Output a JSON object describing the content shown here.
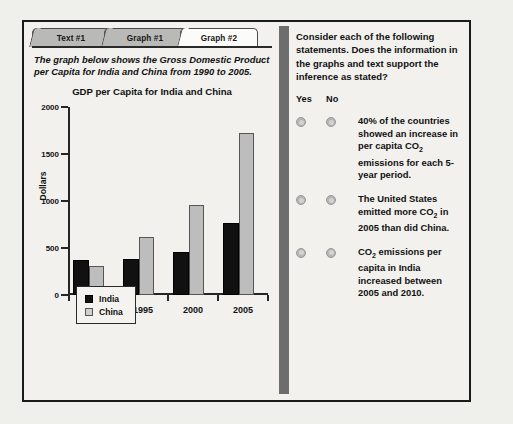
{
  "tabs": [
    {
      "label": "Text #1",
      "active": false
    },
    {
      "label": "Graph #1",
      "active": false
    },
    {
      "label": "Graph #2",
      "active": true
    }
  ],
  "left_panel": {
    "caption": "The graph below shows the Gross Domestic Product per Capita for India and China from 1990 to 2005."
  },
  "chart_data": {
    "type": "bar",
    "title": "GDP per Capita for India and China",
    "xlabel": "",
    "ylabel": "Dollars",
    "ylim": [
      0,
      2000
    ],
    "yticks": [
      0,
      500,
      1000,
      1500,
      2000
    ],
    "ytick_labels": [
      "0",
      "500",
      "1000",
      "1500",
      "2000"
    ],
    "grid": false,
    "legend_position": "below-left",
    "categories": [
      "1990",
      "1995",
      "2000",
      "2005"
    ],
    "series": [
      {
        "name": "India",
        "color": "#111111",
        "values": [
          375,
          385,
          455,
          765
        ]
      },
      {
        "name": "China",
        "color": "#bdbdbd",
        "values": [
          310,
          610,
          955,
          1720
        ]
      }
    ]
  },
  "right_panel": {
    "prompt": "Consider each of the following statements. Does the information in the graphs and text support the inference as stated?",
    "yes_label": "Yes",
    "no_label": "No",
    "statements": [
      {
        "id": "statement-1",
        "text_parts": [
          {
            "t": "40% of the countries showed an increase in per capita CO"
          },
          {
            "t": "2",
            "sub": true
          },
          {
            "t": " emissions for each 5-year period."
          }
        ],
        "plain": "40% of the countries showed an increase in per capita CO2 emissions for each 5-year period."
      },
      {
        "id": "statement-2",
        "text_parts": [
          {
            "t": "The United States emitted more CO"
          },
          {
            "t": "2",
            "sub": true
          },
          {
            "t": " in 2005 than did China."
          }
        ],
        "plain": "The United States emitted more CO2 in 2005 than did China."
      },
      {
        "id": "statement-3",
        "text_parts": [
          {
            "t": "CO"
          },
          {
            "t": "2",
            "sub": true
          },
          {
            "t": " emissions per capita in India increased between 2005 and 2010."
          }
        ],
        "plain": "CO2 emissions per capita in India increased between 2005 and 2010."
      }
    ]
  },
  "colors": {
    "frame": "#1b1b1b",
    "page_background": "#efefec",
    "panel_background": "#f2f1ee",
    "tab_inactive": "#b9b9b7",
    "tab_active": "#fbfbf9",
    "scrollbar": "#6d6d6d",
    "india_bar": "#111111",
    "china_bar": "#bdbdbd",
    "radio": "#b5b5b5"
  }
}
